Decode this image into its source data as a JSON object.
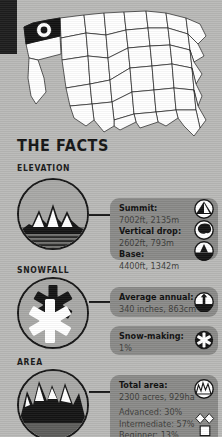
{
  "theme": {
    "page_bg": "#b9b9b7",
    "databox_bg": "#8a8a88",
    "ink": "#141414",
    "value_text": "#3c3c3a",
    "circle_fill": "#a8a8a6",
    "strip_black": "#1d1d1d"
  },
  "map": {
    "name": "usa-locator-map",
    "highlighted_state": "Washington",
    "marker": "resort-location-dot"
  },
  "header": {
    "title": "THE FACTS"
  },
  "sections": [
    {
      "id": "elevation",
      "label": "ELEVATION",
      "icon": "mountain-range-icon",
      "boxes": [
        {
          "id": "elevation-main",
          "rows": [
            {
              "label": "Summit:",
              "value": "7002ft, 2135m",
              "icon": "summit-peak-icon"
            },
            {
              "label": "Vertical drop:",
              "value": "2602ft, 793m",
              "icon": "vertical-drop-icon"
            },
            {
              "label": "Base:",
              "value": "4400ft, 1342m",
              "icon": "base-hill-icon"
            }
          ]
        }
      ]
    },
    {
      "id": "snowfall",
      "label": "SNOWFALL",
      "icon": "snowflake-pair-icon",
      "boxes": [
        {
          "id": "snowfall-average",
          "rows": [
            {
              "label": "Average annual:",
              "value": "340 inches, 863cm",
              "icon": "snow-depth-arrow-icon"
            }
          ]
        },
        {
          "id": "snowfall-snowmaking",
          "rows": [
            {
              "label": "Snow-making:",
              "value": "1%",
              "icon": "snowflake-icon"
            }
          ]
        }
      ]
    },
    {
      "id": "area",
      "label": "AREA",
      "icon": "jagged-peaks-icon",
      "boxes": [
        {
          "id": "area-total",
          "rows": [
            {
              "label": "Total area:",
              "value": "2300 acres, 929ha",
              "icon": "terrain-area-icon"
            }
          ],
          "breakdown": [
            {
              "label": "Advanced: 30%",
              "symbol": "double-black-diamond-icon"
            },
            {
              "label": "Intermediate: 57%",
              "symbol": "blue-square-icon"
            },
            {
              "label": "Beginner: 13%",
              "symbol": "green-circle-icon"
            }
          ]
        }
      ]
    }
  ]
}
